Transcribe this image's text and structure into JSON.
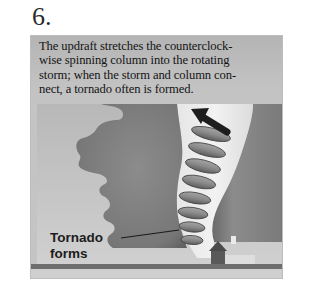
{
  "heading": {
    "step_number": "6."
  },
  "caption": {
    "lines": [
      "The updraft stretches the counterclock-",
      "wise spinning column into the rotating",
      "storm; when the storm and column con-",
      "nect, a tornado often is formed."
    ]
  },
  "diagram": {
    "label": {
      "line1": "Tornado",
      "line2": "forms"
    },
    "elements": [
      "storm-cloud",
      "rotating-column-coil",
      "updraft-arrow",
      "house",
      "ground"
    ],
    "colors": {
      "panel_bg": "#c6c6c6",
      "storm_cloud": "#7e7e7e",
      "right_cloud": "#8a8a8a",
      "coil": "#8f8f8f",
      "ground": "#6e6e6e",
      "house": "#5a5a5a",
      "arrow": "#1e1e1e"
    }
  }
}
